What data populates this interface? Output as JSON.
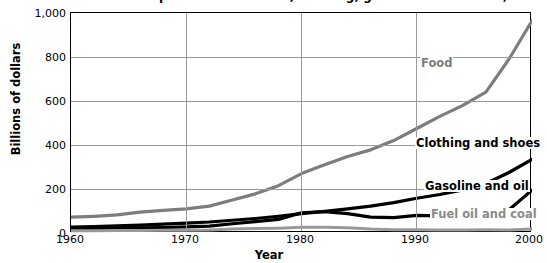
{
  "chart_data": {
    "type": "line",
    "title": "Consumer expenditures on food, clothing, gasoline and fuel oil, 1960–2000",
    "xlabel": "Year",
    "ylabel": "Billions of dollars",
    "xlim": [
      1960,
      2000
    ],
    "ylim": [
      0,
      1000
    ],
    "xticks": [
      "1960",
      "1970",
      "1980",
      "1990",
      "2000"
    ],
    "yticks": [
      "0",
      "200",
      "400",
      "600",
      "800",
      "1,000"
    ],
    "grid": true,
    "legend_position": "inline-annotations",
    "x": [
      1960,
      1962,
      1964,
      1966,
      1968,
      1970,
      1972,
      1974,
      1976,
      1978,
      1980,
      1982,
      1984,
      1986,
      1988,
      1990,
      1992,
      1994,
      1996,
      1998,
      2000
    ],
    "series": [
      {
        "name": "Food",
        "color": "#7d7d7d",
        "label_color": "#7d7d7d",
        "values": [
          72,
          76,
          82,
          95,
          103,
          110,
          122,
          150,
          178,
          215,
          270,
          310,
          348,
          378,
          420,
          475,
          530,
          580,
          640,
          790,
          965
        ]
      },
      {
        "name": "Clothing and shoes",
        "color": "#000000",
        "label_color": "#000000",
        "values": [
          27,
          29,
          32,
          36,
          40,
          45,
          50,
          58,
          66,
          76,
          88,
          98,
          110,
          122,
          138,
          158,
          175,
          196,
          225,
          275,
          335
        ]
      },
      {
        "name": "Gasoline and oil",
        "color": "#000000",
        "label_color": "#000000",
        "values": [
          19,
          20,
          21,
          23,
          25,
          28,
          31,
          42,
          52,
          62,
          92,
          97,
          88,
          72,
          70,
          80,
          78,
          76,
          88,
          105,
          195
        ]
      },
      {
        "name": "Fuel oil and coal",
        "color": "#9a9a9a",
        "label_color": "#8a8a8a",
        "values": [
          10,
          10,
          11,
          11,
          12,
          13,
          14,
          18,
          20,
          22,
          26,
          26,
          24,
          18,
          15,
          15,
          14,
          14,
          15,
          14,
          18
        ]
      }
    ]
  },
  "axis": {
    "y_title": "Billions of dollars",
    "x_title": "Year",
    "y_ticks": [
      "1,000",
      "800",
      "600",
      "400",
      "200",
      "0"
    ],
    "x_ticks": [
      "1960",
      "1970",
      "1980",
      "1990",
      "2000"
    ]
  },
  "labels": {
    "food": "Food",
    "clothing": "Clothing and shoes",
    "gasoline": "Gasoline and oil",
    "fuel_oil": "Fuel oil and coal"
  },
  "title": "Consumer expenditures on food, clothing, gasoline and fuel oil, 1960–2000"
}
